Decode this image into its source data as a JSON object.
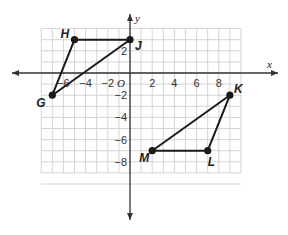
{
  "figure": {
    "axes": {
      "x_label": "x",
      "y_label": "y",
      "origin_label": "O",
      "x_range": [
        -7.5,
        9.5
      ],
      "y_range": [
        -9.5,
        4.5
      ],
      "x_ticks": [
        {
          "value": -6,
          "label": "−6"
        },
        {
          "value": -4,
          "label": "−4"
        },
        {
          "value": -2,
          "label": "−2"
        },
        {
          "value": 2,
          "label": "2"
        },
        {
          "value": 4,
          "label": "4"
        },
        {
          "value": 6,
          "label": "6"
        },
        {
          "value": 8,
          "label": "8"
        }
      ],
      "y_ticks": [
        {
          "value": 2,
          "label": "2"
        },
        {
          "value": -2,
          "label": "−2"
        },
        {
          "value": -4,
          "label": "−4"
        },
        {
          "value": -6,
          "label": "−6"
        },
        {
          "value": -8,
          "label": "−8"
        }
      ]
    },
    "triangles": [
      {
        "name": "GHJ",
        "vertices": [
          {
            "label": "H",
            "x": -5,
            "y": 3
          },
          {
            "label": "J",
            "x": 0,
            "y": 3
          },
          {
            "label": "G",
            "x": -7,
            "y": -2
          }
        ]
      },
      {
        "name": "KLM",
        "vertices": [
          {
            "label": "K",
            "x": 9,
            "y": -2
          },
          {
            "label": "L",
            "x": 7,
            "y": -7
          },
          {
            "label": "M",
            "x": 2,
            "y": -7
          }
        ]
      }
    ],
    "colors": {
      "grid": "#d4d4d4",
      "axis": "#333333",
      "shape": "#1a1a1a"
    }
  }
}
